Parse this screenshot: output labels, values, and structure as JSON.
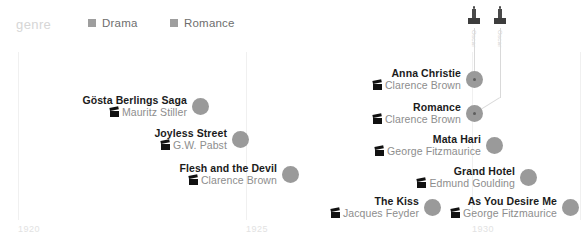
{
  "legend": {
    "title": "genre",
    "items": [
      {
        "label": "Drama",
        "color": "#9e9e9e",
        "icon": "square-swatch"
      },
      {
        "label": "Romance",
        "color": "#9e9e9e",
        "icon": "square-swatch"
      }
    ]
  },
  "axis": {
    "ticks": [
      {
        "label": "1920",
        "x": 18
      },
      {
        "label": "1925",
        "x": 246
      },
      {
        "label": "1930",
        "x": 472
      }
    ],
    "gridlines": [
      18,
      246,
      472,
      580
    ],
    "range": [
      1919,
      1933
    ]
  },
  "awards": [
    {
      "label": "Oscar",
      "icon": "oscar-statuette-icon",
      "x": 474
    },
    {
      "label": "Oscar",
      "icon": "oscar-statuette-icon",
      "x": 500
    }
  ],
  "chart_data": {
    "type": "scatter",
    "title": "genre",
    "xlabel": "",
    "ylabel": "",
    "xlim": [
      1919,
      1933
    ],
    "grid": true,
    "legend_position": "top",
    "categories": [
      "Drama",
      "Romance"
    ],
    "points": [
      {
        "title": "Gösta Berlings Saga",
        "director": "Mauritz Stiller",
        "year": 1924,
        "award": false,
        "dot_x": 200,
        "dot_y": 104,
        "label_side": "left"
      },
      {
        "title": "Joyless Street",
        "director": "G.W. Pabst",
        "year": 1925,
        "award": false,
        "dot_x": 240,
        "dot_y": 137,
        "label_side": "left"
      },
      {
        "title": "Flesh and the Devil",
        "director": "Clarence Brown",
        "year": 1926,
        "award": false,
        "dot_x": 290,
        "dot_y": 172,
        "label_side": "left"
      },
      {
        "title": "Anna Christie",
        "director": "Clarence Brown",
        "year": 1930,
        "award": true,
        "dot_x": 474,
        "dot_y": 77,
        "label_side": "left"
      },
      {
        "title": "Romance",
        "director": "Clarence Brown",
        "year": 1930,
        "award": true,
        "dot_x": 474,
        "dot_y": 111,
        "label_side": "left"
      },
      {
        "title": "Mata Hari",
        "director": "George Fitzmaurice",
        "year": 1931,
        "award": false,
        "dot_x": 494,
        "dot_y": 143,
        "label_side": "left"
      },
      {
        "title": "Grand Hotel",
        "director": "Edmund Goulding",
        "year": 1932,
        "award": false,
        "dot_x": 528,
        "dot_y": 175,
        "label_side": "left"
      },
      {
        "title": "The Kiss",
        "director": "Jacques Feyder",
        "year": 1929,
        "award": false,
        "dot_x": 432,
        "dot_y": 205,
        "label_side": "left"
      },
      {
        "title": "As You Desire Me",
        "director": "George Fitzmaurice",
        "year": 1932,
        "award": false,
        "dot_x": 570,
        "dot_y": 205,
        "label_side": "left"
      }
    ]
  }
}
